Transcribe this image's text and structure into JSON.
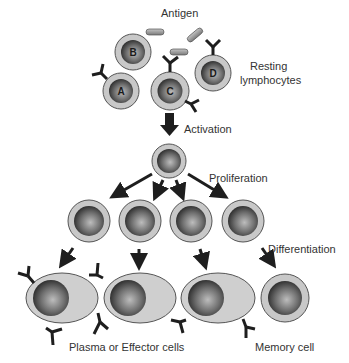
{
  "diagram": {
    "labels": {
      "antigen": "Antigen",
      "resting_line1": "Resting",
      "resting_line2": "lymphocytes",
      "activation": "Activation",
      "proliferation": "Proliferation",
      "differentiation": "Differentiation",
      "plasma": "Plasma or Effector cells",
      "memory": "Memory cell"
    },
    "resting_cells": [
      {
        "letter": "A"
      },
      {
        "letter": "B"
      },
      {
        "letter": "C"
      },
      {
        "letter": "D"
      }
    ],
    "stages": [
      "Resting lymphocytes",
      "Activation",
      "Proliferation",
      "Differentiation"
    ],
    "proliferated_cell_count": 4,
    "effector_cell_count": 3,
    "memory_cell_count": 1,
    "colors": {
      "cytoplasm": "#c8c8c8",
      "cell_outline": "#555555",
      "nucleus_dark": "#2a2a2a",
      "nucleus_light": "#b5b5b5",
      "antibody": "#1e1e1e",
      "antigen": "#9a9a9a"
    }
  }
}
